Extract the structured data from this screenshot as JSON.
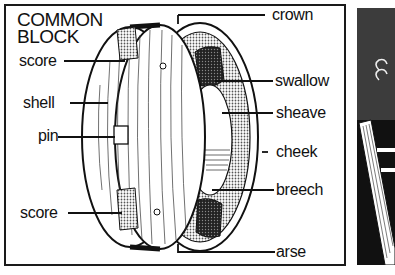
{
  "diagram": {
    "title_line1": "COMMON",
    "title_line2": "BLOCK",
    "labels_left": {
      "score_top": "score",
      "shell": "shell",
      "pin": "pin",
      "score_bottom": "score"
    },
    "labels_right": {
      "crown": "crown",
      "swallow": "swallow",
      "sheave": "sheave",
      "cheek": "cheek",
      "breech": "breech",
      "arse": "arse"
    }
  },
  "colors": {
    "ink": "#111111",
    "shading": "#9a9a9a",
    "dark_panel": "#3a3a3a",
    "paper": "#ffffff"
  }
}
